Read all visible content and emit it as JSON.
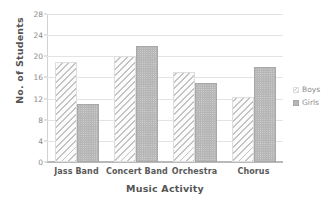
{
  "chart_data": {
    "type": "bar",
    "title": "",
    "xlabel": "Music Activity",
    "ylabel": "No. of Students",
    "categories": [
      "Jass Band",
      "Concert Band",
      "Orchestra",
      "Chorus"
    ],
    "series": [
      {
        "name": "Boys",
        "values": [
          19,
          20,
          17,
          12.3
        ]
      },
      {
        "name": "Girls",
        "values": [
          11,
          22,
          15,
          18
        ]
      }
    ],
    "ylim": [
      0,
      28
    ],
    "yticks": [
      0,
      4,
      8,
      12,
      16,
      20,
      24,
      28
    ],
    "ytick_labels": [
      "0",
      "4",
      "8",
      "12",
      "16",
      "20",
      "24",
      "28"
    ],
    "grid": true,
    "legend_position": "right",
    "colors": {
      "boys": "#c3c3c3",
      "girls": "#b6b6b6",
      "gridline": "#e3e3e3",
      "axis": "#b9b9b9",
      "text": "#6e6e6e"
    }
  },
  "legend": {
    "entries": [
      {
        "label": "Boys",
        "swatch": "hatched-swatch"
      },
      {
        "label": "Girls",
        "swatch": "dotted-swatch"
      }
    ]
  }
}
